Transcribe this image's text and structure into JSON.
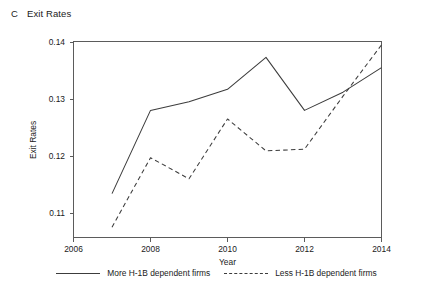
{
  "panel": {
    "letter": "C",
    "title": "Exit Rates"
  },
  "legend": {
    "entries": [
      {
        "label": "More H-1B dependent firms",
        "style": "solid"
      },
      {
        "label": "Less H-1B dependent firms",
        "style": "dashed"
      }
    ]
  },
  "axes": {
    "x_title": "Year",
    "y_title": "Exit Rates",
    "x_ticks": [
      "2006",
      "2008",
      "2010",
      "2012",
      "2014"
    ],
    "y_ticks": [
      "0.11",
      "0.12",
      "0.13",
      "0.14"
    ]
  },
  "chart_data": {
    "type": "line",
    "title": "Exit Rates",
    "xlabel": "Year",
    "ylabel": "Exit Rates",
    "xlim": [
      2006,
      2014
    ],
    "ylim": [
      0.11,
      0.14
    ],
    "xticks": [
      2006,
      2008,
      2010,
      2012,
      2014
    ],
    "yticks": [
      0.11,
      0.12,
      0.13,
      0.14
    ],
    "grid": false,
    "legend_position": "below",
    "x": [
      2007,
      2008,
      2009,
      2010,
      2011,
      2012,
      2013,
      2014
    ],
    "series": [
      {
        "name": "More H-1B dependent firms",
        "style": "solid",
        "values": [
          0.1134,
          0.128,
          0.1295,
          0.1317,
          0.1373,
          0.128,
          0.1312,
          0.1355
        ]
      },
      {
        "name": "Less H-1B dependent firms",
        "style": "dashed",
        "values": [
          0.1075,
          0.1197,
          0.116,
          0.1265,
          0.1209,
          0.1212,
          0.1305,
          0.1395
        ]
      }
    ]
  }
}
